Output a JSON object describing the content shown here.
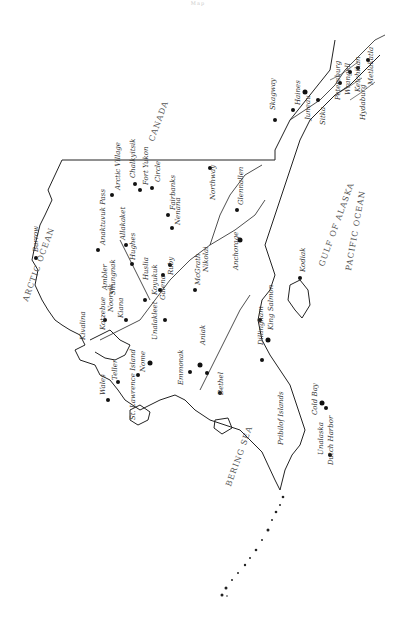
{
  "map": {
    "title_mark": "Map",
    "description": "Hand-drawn outline map of Alaska (rotated), with towns marked as dots",
    "regions": {
      "canada": "CANADA",
      "arctic_ocean": "ARCTIC OCEAN",
      "bering_sea": "BERING SEA",
      "gulf_of_alaska": "GULF OF ALASKA",
      "pacific_ocean": "PACIFIC OCEAN"
    },
    "places": [
      {
        "name": "Barrow"
      },
      {
        "name": "Anaktuvuk Pass"
      },
      {
        "name": "Arctic Village"
      },
      {
        "name": "Allakaket"
      },
      {
        "name": "Hughes"
      },
      {
        "name": "Chalkyitsik"
      },
      {
        "name": "Fort Yukon"
      },
      {
        "name": "Circle"
      },
      {
        "name": "Fairbanks"
      },
      {
        "name": "Nenana"
      },
      {
        "name": "Northway"
      },
      {
        "name": "Glennallen"
      },
      {
        "name": "Anchorage"
      },
      {
        "name": "McGrath"
      },
      {
        "name": "Nikolai"
      },
      {
        "name": "Huslia"
      },
      {
        "name": "Koyukuk"
      },
      {
        "name": "Galena"
      },
      {
        "name": "Ruby"
      },
      {
        "name": "Kotzebue"
      },
      {
        "name": "Noorvik"
      },
      {
        "name": "Kiana"
      },
      {
        "name": "Ambler"
      },
      {
        "name": "Shungnak"
      },
      {
        "name": "Kivalina"
      },
      {
        "name": "Nome"
      },
      {
        "name": "Teller"
      },
      {
        "name": "Wales"
      },
      {
        "name": "Unalakleet"
      },
      {
        "name": "St. Lawrence Island"
      },
      {
        "name": "Bethel"
      },
      {
        "name": "Aniak"
      },
      {
        "name": "Emmonak"
      },
      {
        "name": "Dillingham"
      },
      {
        "name": "King Salmon"
      },
      {
        "name": "Kodiak"
      },
      {
        "name": "Cold Bay"
      },
      {
        "name": "Unalaska"
      },
      {
        "name": "Dutch Harbor"
      },
      {
        "name": "Pribilof Islands"
      },
      {
        "name": "Skagway"
      },
      {
        "name": "Haines"
      },
      {
        "name": "Juneau"
      },
      {
        "name": "Sitka"
      },
      {
        "name": "Petersburg"
      },
      {
        "name": "Wrangell"
      },
      {
        "name": "Ketchikan"
      },
      {
        "name": "Metlakatla"
      },
      {
        "name": "Hydaburg"
      }
    ]
  }
}
